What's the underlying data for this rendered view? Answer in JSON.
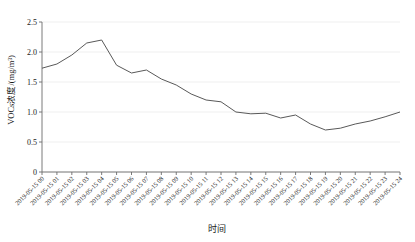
{
  "chart_data": {
    "type": "line",
    "title": "",
    "xlabel": "时间",
    "ylabel": "VOCs浓度/(mg/m³)",
    "ylim": [
      0,
      2.5
    ],
    "yticks": [
      "0",
      "0.5",
      "1.0",
      "1.5",
      "2.0",
      "2.5"
    ],
    "ytick_values": [
      0,
      0.5,
      1.0,
      1.5,
      2.0,
      2.5
    ],
    "grid": true,
    "legend": "none",
    "categories": [
      "2019-05-15 00",
      "2019-05-15 01",
      "2019-05-15 02",
      "2019-05-15 03",
      "2019-05-15 04",
      "2019-05-15 05",
      "2019-05-15 06",
      "2019-05-15 07",
      "2019-05-15 08",
      "2019-05-15 09",
      "2019-05-15 10",
      "2019-05-15 11",
      "2019-05-15 12",
      "2019-05-15 13",
      "2019-05-15 14",
      "2019-05-15 15",
      "2019-05-15 16",
      "2019-05-15 17",
      "2019-05-15 18",
      "2019-05-15 19",
      "2019-05-15 20",
      "2019-05-15 21",
      "2019-05-15 22",
      "2019-05-15 23",
      "2019-05-15 24"
    ],
    "values": [
      1.73,
      1.8,
      1.95,
      2.15,
      2.2,
      1.78,
      1.65,
      1.7,
      1.55,
      1.45,
      1.3,
      1.2,
      1.17,
      1.0,
      0.97,
      0.98,
      0.9,
      0.95,
      0.8,
      0.7,
      0.73,
      0.8,
      0.85,
      0.92,
      1.0
    ],
    "series_color": "#595959"
  }
}
